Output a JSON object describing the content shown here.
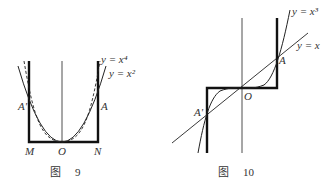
{
  "figures": [
    {
      "id": "fig9",
      "caption_prefix": "图",
      "caption_number": "9",
      "curve_labels": [
        "y = x⁴",
        "y = x²"
      ],
      "point_labels": {
        "A_prime": "A'",
        "A": "A",
        "M": "M",
        "O": "O",
        "N": "N"
      }
    },
    {
      "id": "fig10",
      "caption_prefix": "图",
      "caption_number": "10",
      "curve_labels": [
        "y = x³",
        "y = x"
      ],
      "point_labels": {
        "A_prime": "A'",
        "A": "A",
        "O": "O"
      }
    }
  ],
  "colors": {
    "ink": "#222222",
    "label": "#333333"
  }
}
